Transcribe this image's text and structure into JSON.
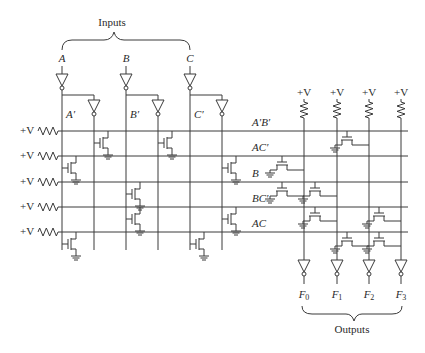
{
  "diagram": {
    "inputs_label": "Inputs",
    "outputs_label": "Outputs",
    "inputs": [
      {
        "name": "A",
        "complement": "A′",
        "x": 62,
        "true_x": 94
      },
      {
        "name": "B",
        "complement": "B′",
        "x": 126,
        "true_x": 158
      },
      {
        "name": "C",
        "complement": "C′",
        "x": 190,
        "true_x": 222
      }
    ],
    "supply_label": "+V",
    "product_terms": [
      {
        "label": "A′B′",
        "y": 131,
        "and_transistor_cols": [
          94,
          158
        ]
      },
      {
        "label": "AC′",
        "y": 156,
        "and_transistor_cols": [
          62,
          222
        ]
      },
      {
        "label": "B",
        "y": 182,
        "and_transistor_cols": [
          126
        ]
      },
      {
        "label": "BC′",
        "y": 207,
        "and_transistor_cols": [
          126,
          222
        ]
      },
      {
        "label": "AC",
        "y": 232,
        "and_transistor_cols": [
          62,
          190
        ]
      }
    ],
    "outputs": [
      {
        "name": "F",
        "sub": "0",
        "x": 304,
        "terms": [
          "AC′",
          "B"
        ]
      },
      {
        "name": "F",
        "sub": "1",
        "x": 337,
        "terms": [
          "B",
          "BC′"
        ]
      },
      {
        "name": "F",
        "sub": "2",
        "x": 369,
        "terms": [
          "A′B′",
          "AC"
        ]
      },
      {
        "name": "F",
        "sub": "3",
        "x": 401,
        "terms": [
          "BC′",
          "AC"
        ]
      }
    ]
  }
}
